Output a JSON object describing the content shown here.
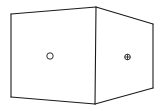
{
  "diagram": {
    "title": "",
    "object": "box",
    "faces": [
      {
        "name": "left-face",
        "marker": "open-circle-icon"
      },
      {
        "name": "right-face",
        "marker": "crosshair-circle-icon"
      }
    ],
    "colors": {
      "stroke": "#1a1a1a",
      "background": "#ffffff"
    }
  }
}
